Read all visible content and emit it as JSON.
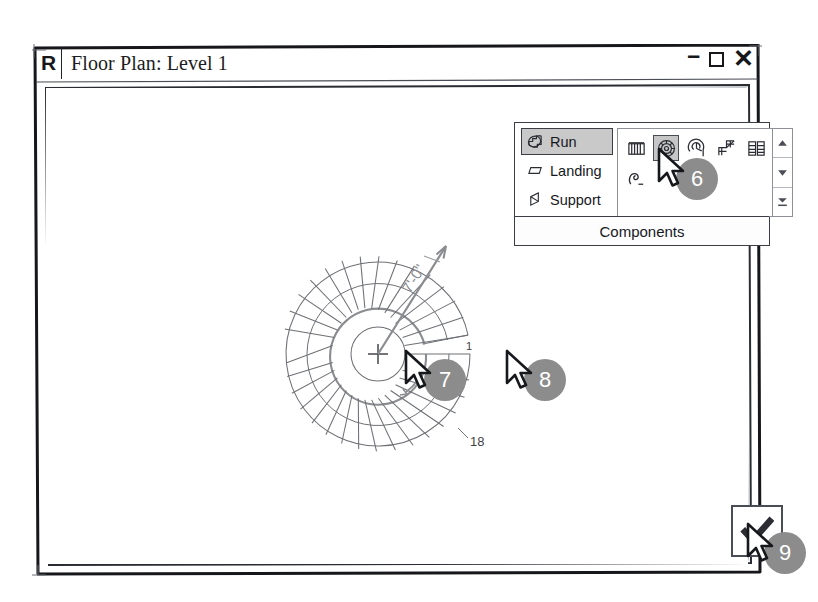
{
  "window": {
    "app_badge": "R",
    "title": "Floor Plan: Level 1",
    "controls": {
      "minimize": "–",
      "maximize": "maximize-icon",
      "close": "✕"
    }
  },
  "ribbon": {
    "panel_label": "Components",
    "left_items": [
      {
        "label": "Run",
        "icon": "stair-run-icon",
        "active": true
      },
      {
        "label": "Landing",
        "icon": "landing-slab-icon",
        "active": false
      },
      {
        "label": "Support",
        "icon": "stringer-support-icon",
        "active": false
      }
    ],
    "gallery_row_1": [
      {
        "icon": "straight-run-icon",
        "name": "straight-run",
        "selected": false
      },
      {
        "icon": "full-step-spiral-icon",
        "name": "full-step-spiral",
        "selected": true
      },
      {
        "icon": "center-ends-spiral-icon",
        "name": "center-ends-spiral",
        "selected": false
      },
      {
        "icon": "l-shape-winder-icon",
        "name": "l-shape-winder",
        "selected": false
      },
      {
        "icon": "u-shape-winder-icon",
        "name": "u-shape-winder",
        "selected": false
      }
    ],
    "gallery_row_2": [
      {
        "icon": "create-sketch-run-icon",
        "name": "create-sketch-run",
        "selected": false
      }
    ],
    "scrollbar": {
      "up": "scroll-up-icon",
      "down": "scroll-down-icon",
      "more": "show-more-icon"
    }
  },
  "drawing": {
    "type": "spiral-stair-plan",
    "radius_dimension": "7'-0\"",
    "first_tread_label": "1",
    "last_tread_label": "18",
    "tread_count": 18,
    "center_marker": "center-point-marker",
    "direction_arrow": "up-direction-arrow"
  },
  "finish": {
    "label": "finish-edit-mode",
    "glyph": "✓"
  },
  "callouts": [
    {
      "id": "6",
      "target": "gallery-full-step-spiral"
    },
    {
      "id": "7",
      "target": "stair-center-point"
    },
    {
      "id": "8",
      "target": "stair-first-tread-end"
    },
    {
      "id": "9",
      "target": "finish-button"
    }
  ],
  "colors": {
    "ink": "#1b1d22",
    "badge_gray": "#8c8c8c",
    "active_fill": "#c9c9c9",
    "drawing_line": "#6e7075",
    "walkline": "#8a8c90"
  }
}
